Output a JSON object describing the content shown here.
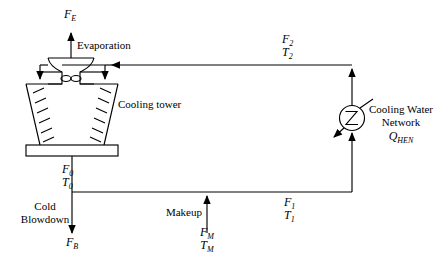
{
  "diagram": {
    "type": "process-flow-diagram",
    "stroke_color": "#000000",
    "background_color": "#ffffff"
  },
  "labels": {
    "evaporation_stream": "F",
    "evaporation_stream_sub": "E",
    "evaporation_text": "Evaporation",
    "cooling_tower": "Cooling tower",
    "return_stream": "F",
    "return_stream_sub": "2",
    "return_temp": "T",
    "return_temp_sub": "2",
    "cold_water_stream": "F",
    "cold_water_stream_sub": "0",
    "cold_water_temp": "T",
    "cold_water_temp_sub": "0",
    "blowdown_line1": "Cold",
    "blowdown_line2": "Blowdown",
    "blowdown_stream": "F",
    "blowdown_stream_sub": "B",
    "makeup_text": "Makeup",
    "makeup_stream": "F",
    "makeup_stream_sub": "M",
    "makeup_temp": "T",
    "makeup_temp_sub": "M",
    "supply_stream": "F",
    "supply_stream_sub": "1",
    "supply_temp": "T",
    "supply_temp_sub": "1",
    "network_line1": "Cooling Water",
    "network_line2": "Network",
    "network_duty": "Q",
    "network_duty_sub": "HEN"
  },
  "icons": {
    "cooling_tower": "cooling-tower-icon",
    "fan": "fan-icon",
    "heat_exchanger": "heat-exchanger-icon",
    "basin": "basin-icon"
  }
}
